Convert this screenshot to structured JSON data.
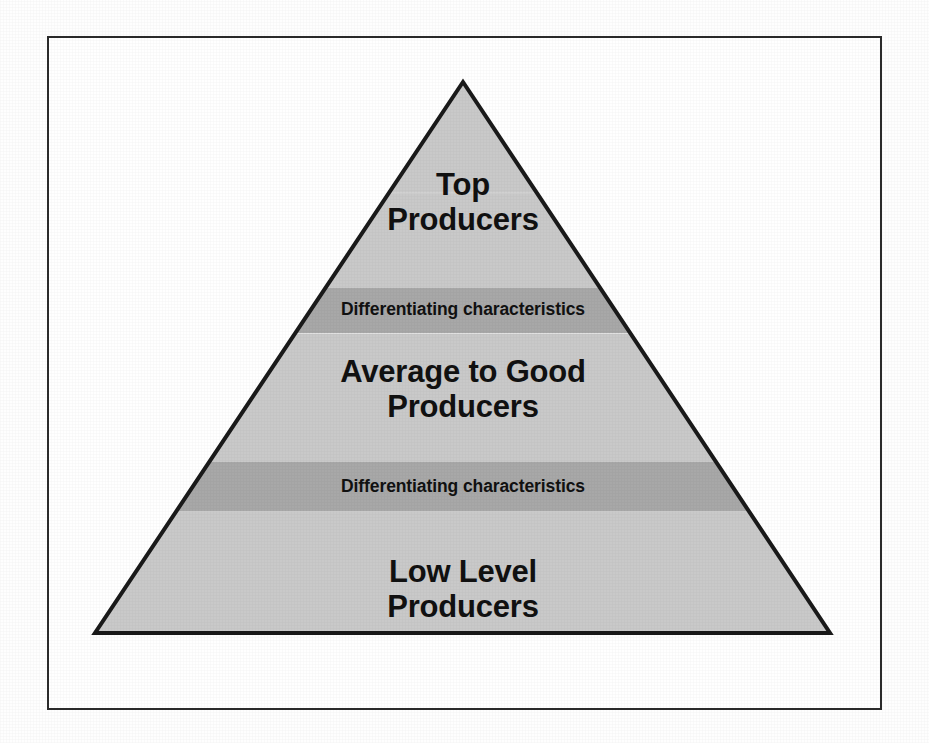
{
  "diagram": {
    "type": "pyramid",
    "frame": {
      "border_color": "#2b2b2b",
      "background_color": "#ffffff"
    },
    "colors": {
      "tier_fill": "#c9c9c9",
      "band_fill": "#a8a8a8",
      "outline": "#1a1a1a",
      "text": "#111111",
      "page_background": "#fefefe"
    },
    "geometry": {
      "apex_x": 463,
      "apex_y": 82,
      "base_left_x": 95,
      "base_right_x": 830,
      "base_y": 633,
      "band1_top_y": 288,
      "band1_bottom_y": 333,
      "band2_top_y": 462,
      "band2_bottom_y": 512
    },
    "tiers": [
      {
        "id": "top-producers",
        "label": "Top\nProducers",
        "level": 1,
        "fill": "#c9c9c9",
        "kind": "tier"
      },
      {
        "id": "differentiating-characteristics-upper",
        "label": "Differentiating characteristics",
        "level": 2,
        "fill": "#a8a8a8",
        "kind": "divider-band"
      },
      {
        "id": "average-to-good-producers",
        "label": "Average to Good\nProducers",
        "level": 3,
        "fill": "#c9c9c9",
        "kind": "tier"
      },
      {
        "id": "differentiating-characteristics-lower",
        "label": "Differentiating characteristics",
        "level": 4,
        "fill": "#a8a8a8",
        "kind": "divider-band"
      },
      {
        "id": "low-level-producers",
        "label": "Low Level\nProducers",
        "level": 5,
        "fill": "#c9c9c9",
        "kind": "tier"
      }
    ]
  }
}
